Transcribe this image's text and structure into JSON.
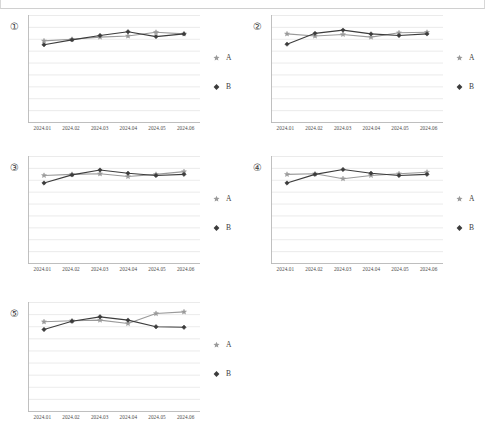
{
  "page": {
    "panel_count": 5,
    "background": "#ffffff",
    "grid_line_color": "#e2e2e2",
    "axis_color": "#b9b9b9"
  },
  "legend": {
    "series": [
      {
        "key": "A",
        "label": "A",
        "marker": "star-marker-icon",
        "color": "#9a9a9a"
      },
      {
        "key": "B",
        "label": "B",
        "marker": "diamond-marker-icon",
        "color": "#3c3c3c"
      }
    ]
  },
  "panels": [
    {
      "index": "①",
      "name": "chart-panel-1"
    },
    {
      "index": "②",
      "name": "chart-panel-2"
    },
    {
      "index": "③",
      "name": "chart-panel-3"
    },
    {
      "index": "④",
      "name": "chart-panel-4"
    },
    {
      "index": "⑤",
      "name": "chart-panel-5"
    }
  ],
  "chart_data": [
    {
      "type": "line",
      "title": "①",
      "xlabel": "",
      "ylabel": "",
      "grid": true,
      "legend_position": "right",
      "ylim": [
        0,
        10
      ],
      "yticks": [
        0,
        1,
        2,
        3,
        4,
        5,
        6,
        7,
        8,
        9,
        10
      ],
      "categories": [
        "2024.01",
        "2024.02",
        "2024.03",
        "2024.04",
        "2024.05",
        "2024.06"
      ],
      "series": [
        {
          "name": "A",
          "values": [
            7.6,
            7.75,
            7.95,
            8.05,
            8.4,
            8.25
          ]
        },
        {
          "name": "B",
          "values": [
            7.25,
            7.7,
            8.1,
            8.45,
            8.0,
            8.25
          ]
        }
      ]
    },
    {
      "type": "line",
      "title": "②",
      "xlabel": "",
      "ylabel": "",
      "grid": true,
      "legend_position": "right",
      "ylim": [
        0,
        10
      ],
      "yticks": [
        0,
        1,
        2,
        3,
        4,
        5,
        6,
        7,
        8,
        9,
        10
      ],
      "categories": [
        "2024.01",
        "2024.02",
        "2024.03",
        "2024.04",
        "2024.05",
        "2024.06"
      ],
      "series": [
        {
          "name": "A",
          "values": [
            8.25,
            8.05,
            8.2,
            7.95,
            8.35,
            8.4
          ]
        },
        {
          "name": "B",
          "values": [
            7.3,
            8.3,
            8.6,
            8.25,
            8.1,
            8.25
          ]
        }
      ]
    },
    {
      "type": "line",
      "title": "③",
      "xlabel": "",
      "ylabel": "",
      "grid": true,
      "legend_position": "right",
      "ylim": [
        0,
        10
      ],
      "yticks": [
        0,
        1,
        2,
        3,
        4,
        5,
        6,
        7,
        8,
        9,
        10
      ],
      "categories": [
        "2024.01",
        "2024.02",
        "2024.03",
        "2024.04",
        "2024.05",
        "2024.06"
      ],
      "series": [
        {
          "name": "A",
          "values": [
            8.2,
            8.3,
            8.35,
            8.1,
            8.3,
            8.55
          ]
        },
        {
          "name": "B",
          "values": [
            7.5,
            8.25,
            8.7,
            8.4,
            8.2,
            8.3
          ]
        }
      ]
    },
    {
      "type": "line",
      "title": "④",
      "xlabel": "",
      "ylabel": "",
      "grid": true,
      "legend_position": "right",
      "ylim": [
        0,
        10
      ],
      "yticks": [
        0,
        1,
        2,
        3,
        4,
        5,
        6,
        7,
        8,
        9,
        10
      ],
      "categories": [
        "2024.01",
        "2024.02",
        "2024.03",
        "2024.04",
        "2024.05",
        "2024.06"
      ],
      "series": [
        {
          "name": "A",
          "values": [
            8.3,
            8.35,
            7.9,
            8.2,
            8.35,
            8.5
          ]
        },
        {
          "name": "B",
          "values": [
            7.5,
            8.3,
            8.75,
            8.4,
            8.2,
            8.3
          ]
        }
      ]
    },
    {
      "type": "line",
      "title": "⑤",
      "xlabel": "",
      "ylabel": "",
      "grid": true,
      "legend_position": "right",
      "ylim": [
        0,
        10
      ],
      "yticks": [
        0,
        1,
        2,
        3,
        4,
        5,
        6,
        7,
        8,
        9,
        10
      ],
      "categories": [
        "2024.01",
        "2024.02",
        "2024.03",
        "2024.04",
        "2024.05",
        "2024.06"
      ],
      "series": [
        {
          "name": "A",
          "values": [
            8.2,
            8.3,
            8.35,
            8.05,
            8.95,
            9.1
          ]
        },
        {
          "name": "B",
          "values": [
            7.5,
            8.25,
            8.65,
            8.35,
            7.75,
            7.7
          ]
        }
      ]
    }
  ]
}
